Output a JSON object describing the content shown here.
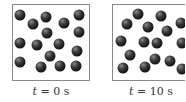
{
  "panels": [
    {
      "caption_var": "t",
      "caption_rest": " = 0 s",
      "particles": [
        [
          20,
          15
        ],
        [
          33,
          24
        ],
        [
          46,
          17
        ],
        [
          64,
          23
        ],
        [
          79,
          15
        ],
        [
          47,
          33
        ],
        [
          79,
          32
        ],
        [
          20,
          43
        ],
        [
          37,
          45
        ],
        [
          59,
          44
        ],
        [
          77,
          51
        ],
        [
          50,
          56
        ],
        [
          20,
          62
        ],
        [
          41,
          67
        ],
        [
          60,
          66
        ],
        [
          76,
          66
        ]
      ]
    },
    {
      "caption_var": "t",
      "caption_rest": " = 10 s",
      "particles": [
        [
          138,
          14
        ],
        [
          161,
          16
        ],
        [
          127,
          24
        ],
        [
          148,
          27
        ],
        [
          167,
          31
        ],
        [
          181,
          23
        ],
        [
          121,
          41
        ],
        [
          144,
          42
        ],
        [
          157,
          43
        ],
        [
          182,
          43
        ],
        [
          130,
          55
        ],
        [
          155,
          59
        ],
        [
          170,
          61
        ],
        [
          123,
          68
        ],
        [
          145,
          67
        ],
        [
          182,
          69
        ]
      ]
    }
  ]
}
